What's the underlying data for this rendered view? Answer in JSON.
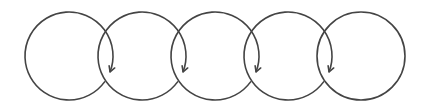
{
  "diagram": {
    "title": "",
    "stroke_color": "#444444",
    "background": "#ffffff",
    "radius": 44,
    "center_y": 56,
    "circles": [
      {
        "id": "circle-1",
        "cx": 69,
        "has_arrow": true
      },
      {
        "id": "circle-2",
        "cx": 142,
        "has_arrow": true
      },
      {
        "id": "circle-3",
        "cx": 215,
        "has_arrow": true
      },
      {
        "id": "circle-4",
        "cx": 288,
        "has_arrow": true
      },
      {
        "id": "circle-5",
        "cx": 361,
        "has_arrow": false
      }
    ],
    "arrow_icon": "arrowhead-down-left"
  }
}
